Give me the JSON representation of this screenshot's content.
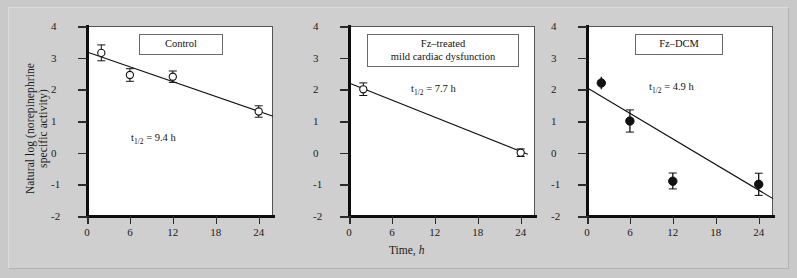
{
  "figure": {
    "background_color": "#cfcfcf",
    "axis_label_x": "Time, h",
    "axis_label_y_line1": "Natural log (norepinephrine",
    "axis_label_y_line2": "specific activity)"
  },
  "axes": {
    "y_ticks": [
      "4",
      "3",
      "2",
      "1",
      "0",
      "-1",
      "-2"
    ],
    "y_values": [
      4,
      3,
      2,
      1,
      0,
      -1,
      -2
    ],
    "x_ticks": [
      "0",
      "6",
      "12",
      "18",
      "24"
    ],
    "x_values": [
      0,
      6,
      12,
      18,
      24
    ],
    "xlim": [
      0,
      26
    ],
    "ylim": [
      -2,
      4
    ]
  },
  "chart_data": {
    "type": "scatter",
    "title": "",
    "xlabel": "Time, h",
    "ylabel": "Natural log (norepinephrine specific activity)",
    "xlim": [
      0,
      26
    ],
    "ylim": [
      -2,
      4
    ],
    "grid": false,
    "legend_position": "inside-top",
    "panels": [
      {
        "id": "control",
        "label": "Control",
        "annotation": "t1/2 = 9.4 h",
        "half_life_value": 9.4,
        "half_life_unit": "h",
        "marker": "open-circle",
        "x": [
          2,
          6,
          12,
          24
        ],
        "y": [
          3.15,
          2.45,
          2.4,
          1.3
        ],
        "yerr": [
          0.25,
          0.2,
          0.18,
          0.18
        ],
        "fit_line": {
          "x": [
            0,
            26
          ],
          "y": [
            3.18,
            1.15
          ]
        }
      },
      {
        "id": "fz-treated-mild-cardiac-dysfunction",
        "label_line1": "Fz–treated",
        "label_line2": "mild cardiac dysfunction",
        "annotation": "t1/2 = 7.7 h",
        "half_life_value": 7.7,
        "half_life_unit": "h",
        "marker": "open-circle",
        "x": [
          2,
          24
        ],
        "y": [
          2.0,
          0.0
        ],
        "yerr": [
          0.2,
          0.12
        ],
        "fit_line": {
          "x": [
            0,
            25
          ],
          "y": [
            2.2,
            -0.05
          ]
        }
      },
      {
        "id": "fz-dcm",
        "label": "Fz–DCM",
        "annotation": "t1/2 = 4.9 h",
        "half_life_value": 4.9,
        "half_life_unit": "h",
        "marker": "filled-circle",
        "x": [
          2,
          6,
          12,
          24
        ],
        "y": [
          2.2,
          1.0,
          -0.9,
          -1.0
        ],
        "yerr": [
          0.2,
          0.35,
          0.25,
          0.35
        ],
        "fit_line": {
          "x": [
            0,
            26
          ],
          "y": [
            2.05,
            -1.45
          ]
        }
      }
    ]
  },
  "panel1": {
    "legend": "Control",
    "halflife_prefix": "t",
    "halflife_sub": "1/2",
    "halflife_rest": " = 9.4 h"
  },
  "panel2": {
    "legend_line1": "Fz–treated",
    "legend_line2": "mild cardiac dysfunction",
    "halflife_prefix": "t",
    "halflife_sub": "1/2",
    "halflife_rest": " = 7.7 h"
  },
  "panel3": {
    "legend": "Fz–DCM",
    "halflife_prefix": "t",
    "halflife_sub": "1/2",
    "halflife_rest": " = 4.9 h"
  }
}
